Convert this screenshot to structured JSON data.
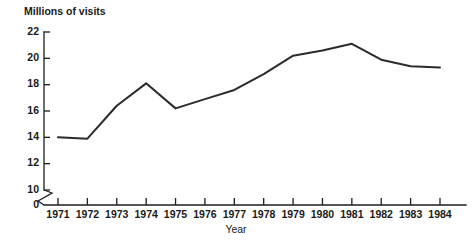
{
  "chart_data": {
    "type": "line",
    "title": "",
    "ylabel": "Millions of visits",
    "xlabel": "Year",
    "x": [
      1971,
      1972,
      1973,
      1974,
      1975,
      1976,
      1977,
      1978,
      1979,
      1980,
      1981,
      1982,
      1983,
      1984
    ],
    "categories": [
      "1971",
      "1972",
      "1973",
      "1974",
      "1975",
      "1976",
      "1977",
      "1978",
      "1979",
      "1980",
      "1981",
      "1982",
      "1983",
      "1984"
    ],
    "values": [
      14.0,
      13.9,
      16.4,
      18.1,
      16.2,
      16.9,
      17.6,
      18.8,
      20.2,
      20.6,
      21.1,
      19.9,
      19.4,
      19.3
    ],
    "series": [
      {
        "name": "Millions of visits",
        "values": [
          14.0,
          13.9,
          16.4,
          18.1,
          16.2,
          16.9,
          17.6,
          18.8,
          20.2,
          20.6,
          21.1,
          19.9,
          19.4,
          19.3
        ]
      }
    ],
    "ylim": [
      10,
      22
    ],
    "yticks": [
      10,
      12,
      14,
      16,
      18,
      20,
      22
    ],
    "ytick_labels": [
      "10",
      "12",
      "14",
      "16",
      "18",
      "20",
      "22"
    ],
    "y_origin_label": "0",
    "y_axis_break": true,
    "xlim": [
      1971,
      1984
    ],
    "grid": false,
    "legend": false,
    "legend_position": "none",
    "line_color": "#2b2b2b",
    "axis_color": "#1e1e1e",
    "background_color": "#ffffff"
  },
  "labels": {
    "y_axis_title": "Millions of visits",
    "x_axis_title": "Year"
  }
}
